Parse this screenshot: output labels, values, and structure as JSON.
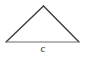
{
  "canvas": {
    "width": 86,
    "height": 57,
    "background": "#ffffff"
  },
  "figure": {
    "name": "triangle",
    "stroke_color": "#3d3d3d",
    "base_stroke_color": "#6b6b6b",
    "stroke_width": 1.4,
    "base_stroke_width": 1,
    "vertices": {
      "apex": {
        "x": 43.5,
        "y": 6
      },
      "bottom_left": {
        "x": 6,
        "y": 42
      },
      "bottom_right": {
        "x": 79,
        "y": 42
      }
    },
    "points_attr": "43.5,6 79,42 6,42"
  },
  "labels": {
    "base_side": "c",
    "base_side_color": "#2f2f2f"
  }
}
